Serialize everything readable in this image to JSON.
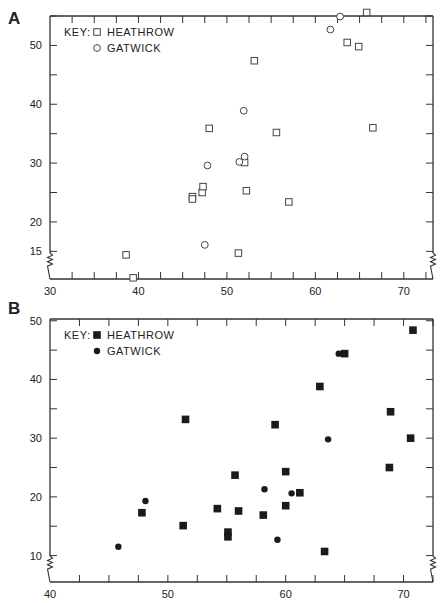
{
  "figure": {
    "panels": [
      "A",
      "B"
    ]
  },
  "chart_data": [
    {
      "panel": "A",
      "type": "scatter",
      "title": "",
      "xlabel": "",
      "ylabel": "",
      "xlim": [
        30,
        73.3
      ],
      "ylim": [
        10.3,
        55
      ],
      "x_ticks_labeled": [
        30,
        40,
        50,
        60,
        70
      ],
      "x_minor_step": 2.5,
      "y_ticks_labeled": [
        15,
        20,
        30,
        40,
        50
      ],
      "y_minor_step": 5,
      "grid": false,
      "axis_breaks": [
        "left-bottom",
        "right-bottom"
      ],
      "legend": {
        "title": "KEY:",
        "position": "top-left",
        "entries": [
          {
            "label": "HEATHROW",
            "marker": "open-square"
          },
          {
            "label": "GATWICK",
            "marker": "open-circle"
          }
        ]
      },
      "series": [
        {
          "name": "HEATHROW",
          "marker": "open-square",
          "points": [
            [
              38.6,
              14.4
            ],
            [
              39.4,
              10.5
            ],
            [
              46.1,
              24.3
            ],
            [
              46.1,
              23.9
            ],
            [
              47.2,
              25.0
            ],
            [
              47.3,
              26.0
            ],
            [
              48.0,
              35.9
            ],
            [
              51.3,
              14.7
            ],
            [
              52.0,
              30.1
            ],
            [
              52.2,
              25.3
            ],
            [
              53.1,
              47.4
            ],
            [
              55.6,
              35.2
            ],
            [
              57.0,
              23.4
            ],
            [
              63.6,
              50.5
            ],
            [
              64.9,
              49.8
            ],
            [
              65.8,
              55.6
            ],
            [
              66.5,
              36.0
            ]
          ]
        },
        {
          "name": "GATWICK",
          "marker": "open-circle",
          "points": [
            [
              47.5,
              16.1
            ],
            [
              47.8,
              29.6
            ],
            [
              51.4,
              30.2
            ],
            [
              52.0,
              31.1
            ],
            [
              51.9,
              38.9
            ],
            [
              61.7,
              52.7
            ],
            [
              62.8,
              54.9
            ]
          ]
        }
      ]
    },
    {
      "panel": "B",
      "type": "scatter",
      "title": "",
      "xlabel": "",
      "ylabel": "",
      "xlim": [
        40,
        72.5
      ],
      "ylim": [
        5.5,
        50.3
      ],
      "x_ticks_labeled": [
        40,
        50,
        60,
        70
      ],
      "x_minor_step": 2.5,
      "y_ticks_labeled": [
        10,
        20,
        30,
        40,
        50
      ],
      "y_minor_step": 5,
      "grid": false,
      "axis_breaks": [
        "left-bottom",
        "right-bottom"
      ],
      "legend": {
        "title": "KEY:",
        "position": "top-left",
        "entries": [
          {
            "label": "HEATHROW",
            "marker": "filled-square"
          },
          {
            "label": "GATWICK",
            "marker": "filled-circle"
          }
        ]
      },
      "series": [
        {
          "name": "HEATHROW",
          "marker": "filled-square",
          "points": [
            [
              47.8,
              17.3
            ],
            [
              51.3,
              15.1
            ],
            [
              51.5,
              33.2
            ],
            [
              54.2,
              18.0
            ],
            [
              55.1,
              14.0
            ],
            [
              55.1,
              13.2
            ],
            [
              55.7,
              23.7
            ],
            [
              56.0,
              17.6
            ],
            [
              58.1,
              16.9
            ],
            [
              59.1,
              32.3
            ],
            [
              60.0,
              24.3
            ],
            [
              60.0,
              18.5
            ],
            [
              61.2,
              20.7
            ],
            [
              62.9,
              38.8
            ],
            [
              63.3,
              10.7
            ],
            [
              65.0,
              44.4
            ],
            [
              68.8,
              25.0
            ],
            [
              68.9,
              34.5
            ],
            [
              70.6,
              30.0
            ],
            [
              70.8,
              48.4
            ]
          ]
        },
        {
          "name": "GATWICK",
          "marker": "filled-circle",
          "points": [
            [
              45.8,
              11.5
            ],
            [
              48.1,
              19.3
            ],
            [
              58.2,
              21.3
            ],
            [
              59.3,
              12.7
            ],
            [
              60.5,
              20.6
            ],
            [
              63.6,
              29.8
            ],
            [
              64.5,
              44.4
            ]
          ]
        }
      ]
    }
  ]
}
